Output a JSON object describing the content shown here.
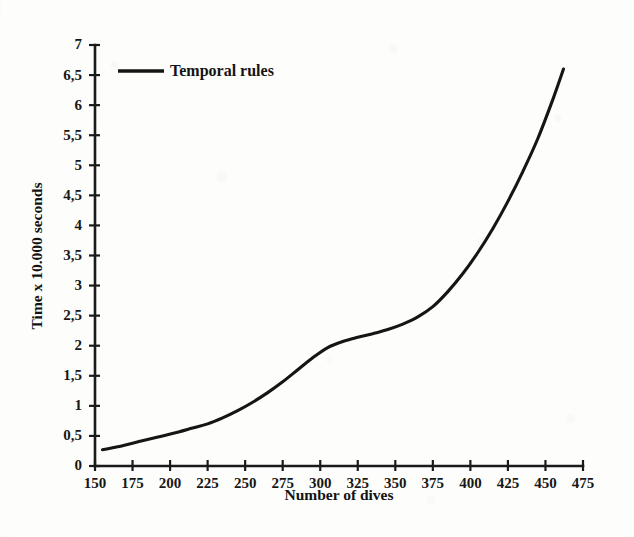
{
  "chart_data": {
    "type": "line",
    "title": "",
    "xlabel": "Number of dives",
    "ylabel": "Time x 10.000 seconds",
    "xlim": [
      150,
      475
    ],
    "ylim": [
      0,
      7
    ],
    "grid": false,
    "legend_position": "top-left",
    "decimal_separator": ",",
    "x_ticks": [
      150,
      175,
      200,
      225,
      250,
      275,
      300,
      325,
      350,
      375,
      400,
      425,
      450,
      475
    ],
    "x_tick_labels": [
      "150",
      "175",
      "200",
      "225",
      "250",
      "275",
      "300",
      "325",
      "350",
      "375",
      "400",
      "425",
      "450",
      "475"
    ],
    "y_ticks": [
      0,
      0.5,
      1,
      1.5,
      2,
      2.5,
      3,
      3.5,
      4,
      4.5,
      5,
      5.5,
      6,
      6.5,
      7
    ],
    "y_tick_labels": [
      "0",
      "0,5",
      "1",
      "1,5",
      "2",
      "2,5",
      "3",
      "3,5",
      "4",
      "4,5",
      "5",
      "5,5",
      "6",
      "6,5",
      "7"
    ],
    "series": [
      {
        "name": "Temporal rules",
        "color": "#151515",
        "x": [
          155,
          165,
          175,
          185,
          195,
          205,
          215,
          225,
          235,
          245,
          255,
          265,
          275,
          285,
          295,
          305,
          315,
          325,
          335,
          345,
          355,
          365,
          375,
          385,
          395,
          405,
          415,
          425,
          435,
          445,
          455,
          462
        ],
        "values": [
          0.27,
          0.32,
          0.38,
          0.44,
          0.5,
          0.56,
          0.63,
          0.7,
          0.8,
          0.92,
          1.06,
          1.22,
          1.4,
          1.6,
          1.8,
          1.97,
          2.07,
          2.14,
          2.2,
          2.27,
          2.36,
          2.48,
          2.65,
          2.9,
          3.2,
          3.55,
          3.95,
          4.4,
          4.9,
          5.45,
          6.1,
          6.6
        ]
      }
    ]
  },
  "legend": {
    "entries": [
      {
        "label": "Temporal rules"
      }
    ]
  },
  "axes": {
    "x_title": "Number of dives",
    "y_title": "Time x 10.000 seconds"
  }
}
